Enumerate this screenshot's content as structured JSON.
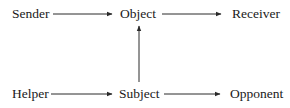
{
  "diagram": {
    "type": "actantial-model",
    "nodes": {
      "sender": {
        "label": "Sender"
      },
      "object": {
        "label": "Object"
      },
      "receiver": {
        "label": "Receiver"
      },
      "helper": {
        "label": "Helper"
      },
      "subject": {
        "label": "Subject"
      },
      "opponent": {
        "label": "Opponent"
      }
    },
    "edges": [
      {
        "from": "Sender",
        "to": "Object"
      },
      {
        "from": "Object",
        "to": "Receiver"
      },
      {
        "from": "Subject",
        "to": "Object"
      },
      {
        "from": "Helper",
        "to": "Subject"
      },
      {
        "from": "Subject",
        "to": "Opponent"
      }
    ],
    "colors": {
      "text": "#1a1a1a",
      "line": "#2a2a2a",
      "background": "#ffffff"
    }
  }
}
